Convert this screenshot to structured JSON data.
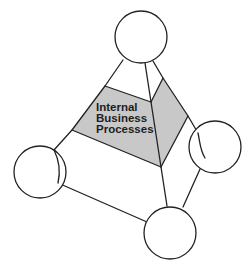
{
  "diagram": {
    "type": "tetrahedral-perspective-diagram",
    "highlighted_face": {
      "label_lines": [
        "Internal",
        "Business",
        "Processes"
      ],
      "fill_color": "#c8c8c8"
    },
    "nodes": [
      {
        "id": "top",
        "label": ""
      },
      {
        "id": "right",
        "label": ""
      },
      {
        "id": "left",
        "label": ""
      },
      {
        "id": "bottom",
        "label": ""
      }
    ],
    "colors": {
      "line": "#222222",
      "background": "#ffffff",
      "highlight": "#c8c8c8"
    }
  }
}
